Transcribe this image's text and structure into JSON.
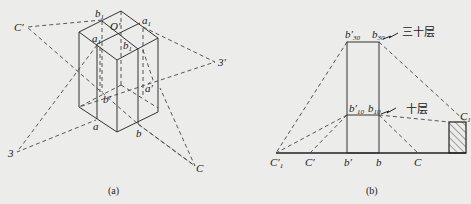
{
  "figure_a": {
    "caption": "(a)",
    "labels": {
      "b1_prime": "b",
      "O_prime": "O′",
      "a1_prime": "a",
      "a1": "a",
      "b1": "b",
      "C_prime": "C′",
      "three_prime": "3′",
      "b_prime": "b′",
      "a_prime": "a′",
      "a": "a",
      "b": "b",
      "three": "3",
      "C": "C"
    },
    "subscripts": {
      "one": "1",
      "prime": "′"
    }
  },
  "figure_b": {
    "caption": "(b)",
    "labels": {
      "b30_prime": "b′",
      "b30": "b",
      "sub30": "30",
      "b10_prime": "b′",
      "b10": "b",
      "sub10": "10",
      "C1_prime": "C′",
      "C_prime": "C′",
      "b_prime": "b′",
      "b": "b",
      "C": "C",
      "C1": "C",
      "sub1": "1"
    },
    "annotations": {
      "floor30": "三十层",
      "floor10": "十层"
    }
  }
}
